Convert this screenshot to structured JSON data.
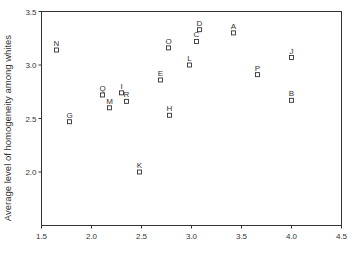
{
  "chart_data": {
    "type": "scatter",
    "title": "",
    "xlabel": "",
    "ylabel": "Average level of homogeneity among whites",
    "xlim": [
      1.5,
      4.5
    ],
    "ylim": [
      1.5,
      3.5
    ],
    "xticks": [
      "1.5",
      "2.0",
      "2.5",
      "3.0",
      "3.5",
      "4.0",
      "4.5"
    ],
    "yticks": [
      "2.0",
      "2.5",
      "3.0",
      "3.5"
    ],
    "grid": false,
    "legend": null,
    "marker": "open-square",
    "points": [
      {
        "label": "A",
        "x": 3.42,
        "y": 3.3
      },
      {
        "label": "B",
        "x": 4.0,
        "y": 2.67
      },
      {
        "label": "C",
        "x": 3.05,
        "y": 3.22
      },
      {
        "label": "D",
        "x": 3.08,
        "y": 3.33
      },
      {
        "label": "E",
        "x": 2.69,
        "y": 2.86
      },
      {
        "label": "G",
        "x": 1.78,
        "y": 2.47
      },
      {
        "label": "H",
        "x": 2.78,
        "y": 2.53
      },
      {
        "label": "I",
        "x": 2.3,
        "y": 2.74
      },
      {
        "label": "J",
        "x": 4.0,
        "y": 3.07
      },
      {
        "label": "K",
        "x": 2.48,
        "y": 2.0
      },
      {
        "label": "L",
        "x": 2.98,
        "y": 3.0
      },
      {
        "label": "M",
        "x": 2.18,
        "y": 2.6
      },
      {
        "label": "N",
        "x": 1.65,
        "y": 3.14
      },
      {
        "label": "O",
        "x": 2.77,
        "y": 3.16
      },
      {
        "label": "P",
        "x": 3.66,
        "y": 2.91
      },
      {
        "label": "Q",
        "x": 2.11,
        "y": 2.72
      },
      {
        "label": "R",
        "x": 2.35,
        "y": 2.66
      }
    ]
  },
  "colors": {
    "axis": "#333333",
    "marker_fill": "#ffffff",
    "background": "#ffffff"
  }
}
